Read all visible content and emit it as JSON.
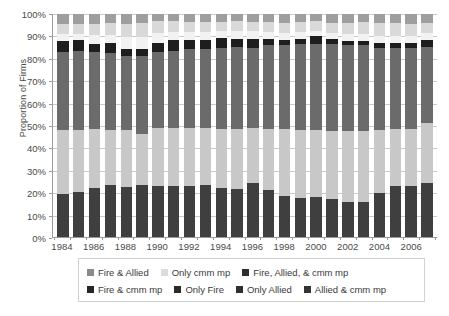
{
  "chart_data": {
    "type": "bar",
    "subtype": "stacked-100-percent-column",
    "title": "",
    "xlabel": "",
    "ylabel": "Proportion of Firms",
    "ylim": [
      0,
      100
    ],
    "yticks": [
      "0%",
      "10%",
      "20%",
      "30%",
      "40%",
      "50%",
      "60%",
      "70%",
      "80%",
      "90%",
      "100%"
    ],
    "ytick_values": [
      0,
      10,
      20,
      30,
      40,
      50,
      60,
      70,
      80,
      90,
      100
    ],
    "grid": true,
    "legend_position": "bottom",
    "categories": [
      "1984",
      "1985",
      "1986",
      "1987",
      "1988",
      "1989",
      "1990",
      "1991",
      "1992",
      "1993",
      "1994",
      "1995",
      "1996",
      "1997",
      "1998",
      "1999",
      "2000",
      "2001",
      "2002",
      "2003",
      "2004",
      "2005",
      "2006",
      "2007"
    ],
    "xtick_labels": [
      "1984",
      "1986",
      "1988",
      "1990",
      "1992",
      "1994",
      "1996",
      "1998",
      "2000",
      "2002",
      "2004",
      "2006"
    ],
    "series": [
      {
        "name": "Only Fire",
        "color": "#3f3f3f",
        "stack_order": 1,
        "values": [
          19.5,
          20.0,
          21.8,
          23.2,
          22.3,
          23.5,
          22.8,
          22.7,
          23.0,
          23.3,
          22.2,
          21.7,
          24.4,
          21.0,
          18.6,
          17.4,
          17.8,
          17.0,
          15.6,
          15.9,
          19.9,
          22.9,
          23.0,
          24.0
        ]
      },
      {
        "name": "Fire & Allied",
        "color": "#c8c8c8",
        "stack_order": 2,
        "values": [
          28.5,
          27.8,
          26.5,
          25.0,
          25.8,
          22.5,
          26.0,
          26.2,
          25.8,
          25.5,
          26.4,
          26.8,
          24.3,
          27.4,
          29.7,
          30.8,
          30.2,
          30.5,
          31.9,
          31.5,
          28.0,
          25.4,
          25.4,
          27.0
        ]
      },
      {
        "name": "Fire, Allied, & cmm mp",
        "color": "#6b6b6b",
        "stack_order": 3,
        "values": [
          35.0,
          35.5,
          34.5,
          34.5,
          33.0,
          35.0,
          34.0,
          34.5,
          35.5,
          35.5,
          36.0,
          36.5,
          36.0,
          37.5,
          38.0,
          38.5,
          38.5,
          39.0,
          38.5,
          38.5,
          37.0,
          36.5,
          36.5,
          34.0
        ]
      },
      {
        "name": "Only Allied",
        "color": "#1e1e1e",
        "stack_order": 4,
        "values": [
          5.0,
          5.2,
          3.7,
          4.3,
          3.4,
          3.5,
          4.2,
          4.8,
          4.2,
          4.0,
          4.5,
          4.0,
          4.3,
          3.1,
          2.2,
          2.3,
          3.5,
          2.2,
          2.0,
          2.1,
          2.1,
          2.2,
          2.1,
          3.5
        ]
      },
      {
        "name": "Allied & cmm mp",
        "color": "#f2f2f2",
        "stack_order": 5,
        "values": [
          3.2,
          2.6,
          4.2,
          3.8,
          5.4,
          5.3,
          4.4,
          3.9,
          3.6,
          3.7,
          3.2,
          3.5,
          3.3,
          3.0,
          3.1,
          3.0,
          2.5,
          3.0,
          3.0,
          3.0,
          3.0,
          3.0,
          3.0,
          3.0
        ]
      },
      {
        "name": "Only cmm mp",
        "color": "#d9d9d9",
        "stack_order": 6,
        "values": [
          4.3,
          4.4,
          4.8,
          5.2,
          5.6,
          6.2,
          5.3,
          4.9,
          4.5,
          4.5,
          4.2,
          4.2,
          4.2,
          4.3,
          4.6,
          4.3,
          4.2,
          4.5,
          5.2,
          5.3,
          6.0,
          5.8,
          5.5,
          4.5
        ]
      },
      {
        "name": "Fire & cmm mp",
        "color": "#9e9e9e",
        "stack_order": 7,
        "values": [
          4.5,
          4.5,
          4.5,
          4.0,
          4.5,
          4.0,
          3.3,
          3.0,
          3.4,
          3.5,
          3.5,
          3.3,
          3.5,
          3.7,
          3.8,
          3.7,
          3.3,
          3.8,
          3.8,
          3.7,
          4.0,
          4.2,
          4.5,
          4.0
        ]
      }
    ]
  },
  "legend": {
    "row1": [
      {
        "label": "Fire & Allied",
        "color": "#8a8a8a"
      },
      {
        "label": "Only cmm mp",
        "color": "#dcdcdc"
      },
      {
        "label": "Fire, Allied, & cmm mp",
        "color": "#2e2e2e"
      }
    ],
    "row2": [
      {
        "label": "Fire & cmm mp",
        "color": "#262626"
      },
      {
        "label": "Only Fire",
        "color": "#2b2b2b"
      },
      {
        "label": "Only Allied",
        "color": "#303030"
      },
      {
        "label": "Allied & cmm mp",
        "color": "#343434"
      }
    ]
  },
  "axis": {
    "y_title": "Proportion of Firms"
  }
}
